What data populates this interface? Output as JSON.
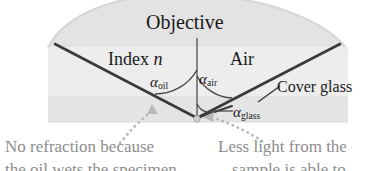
{
  "figure": {
    "labels": {
      "objective": "Objective",
      "index_prefix": "Index ",
      "index_symbol": "n",
      "air": "Air",
      "cover_glass": "Cover glass"
    },
    "angles": {
      "oil": {
        "symbol": "α",
        "subscript": "oil"
      },
      "air": {
        "symbol": "α",
        "subscript": "air"
      },
      "glass": {
        "symbol": "α",
        "subscript": "glass"
      }
    },
    "captions": {
      "left_line1": "No refraction because",
      "left_line2": "the oil wets the specimen",
      "right_line1": "Less light from the",
      "right_line2": "sample is able to",
      "caption_color": "#8d8d8d"
    },
    "colors": {
      "background": "#ffffff",
      "objective_fill": "#e2e2e2",
      "cover_glass_fill": "#e4e4e4",
      "ray_stroke": "#3a3a3a",
      "arc_stroke": "#4a4a4a",
      "dotted_arrow": "#b3b3b3",
      "text": "#1a1a1a"
    },
    "geometry": {
      "vertex_x": 197,
      "vertex_y": 118,
      "optical_axis_top_y": 38,
      "cover_glass_band_top_y": 97,
      "cover_glass_band_bottom_y": 122,
      "cover_glass_band_left_x": 48,
      "cover_glass_band_right_x": 348
    }
  }
}
